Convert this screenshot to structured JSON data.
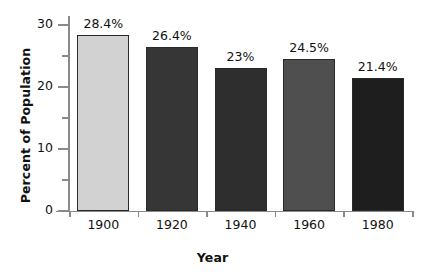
{
  "chart_data": {
    "type": "bar",
    "title": "",
    "xlabel": "Year",
    "ylabel": "Percent of Population",
    "categories": [
      "1900",
      "1920",
      "1940",
      "1960",
      "1980"
    ],
    "values": [
      28.4,
      26.4,
      23,
      24.5,
      21.4
    ],
    "value_labels": [
      "28.4%",
      "26.4%",
      "23%",
      "24.5%",
      "21.4%"
    ],
    "bar_colors": [
      "#d2d2d2",
      "#363636",
      "#2e2e2e",
      "#4f4f4f",
      "#1e1e1e"
    ],
    "bar_border_color": "#2a2a2a",
    "ylim": [
      0,
      31.5
    ],
    "y_major_ticks": [
      "0",
      "10",
      "20",
      "30"
    ],
    "y_major_tick_values": [
      0,
      10,
      20,
      30
    ],
    "y_minor_tick_values": [
      5,
      15,
      25
    ],
    "grid": false,
    "legend": null,
    "axis_color": "#8a8a8a",
    "text_color": "#111111",
    "background": "#ffffff"
  }
}
